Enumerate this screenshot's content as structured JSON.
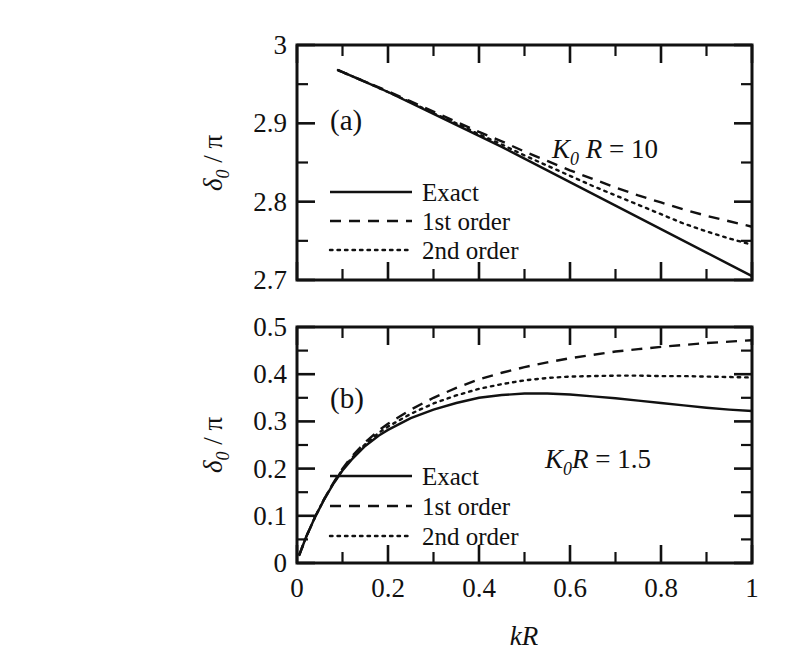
{
  "figure": {
    "xlabel": "kR",
    "ylabel_delta": "δ",
    "ylabel_sub": "0",
    "ylabel_slash": " / π"
  },
  "panel_a": {
    "label": "(a)",
    "annotation_k": "K",
    "annotation_sub": "0",
    "annotation_r": " R ",
    "annotation_eq": "= 10",
    "ytick_labels": [
      "2.7",
      "2.8",
      "2.9",
      "3"
    ],
    "legend": [
      {
        "label": "Exact",
        "style": "solid"
      },
      {
        "label": "1st order",
        "style": "dashed"
      },
      {
        "label": "2nd order",
        "style": "dotted"
      }
    ]
  },
  "panel_b": {
    "label": "(b)",
    "annotation_k": "K",
    "annotation_sub": "0",
    "annotation_r": "R ",
    "annotation_eq": " = 1.5",
    "ytick_labels": [
      "0",
      "0.1",
      "0.2",
      "0.3",
      "0.4",
      "0.5"
    ],
    "xtick_labels": [
      "0",
      "0.2",
      "0.4",
      "0.6",
      "0.8",
      "1"
    ],
    "legend": [
      {
        "label": "Exact",
        "style": "solid"
      },
      {
        "label": "1st order",
        "style": "dashed"
      },
      {
        "label": "2nd order",
        "style": "dotted"
      }
    ]
  },
  "chart_data": {
    "type": "line",
    "title": "",
    "xlabel": "kR",
    "ylabel": "δ₀ / π",
    "panels": [
      {
        "id": "a",
        "label": "(a)",
        "annotation": "K₀ R = 10",
        "xlim": [
          0,
          1
        ],
        "ylim": [
          2.7,
          3.0
        ],
        "xticks": [
          0,
          0.2,
          0.4,
          0.6,
          0.8,
          1.0
        ],
        "yticks": [
          2.7,
          2.8,
          2.9,
          3.0
        ],
        "yminor": [
          2.75,
          2.85,
          2.95
        ],
        "xminor": [
          0.1,
          0.3,
          0.5,
          0.7,
          0.9
        ],
        "grid": false,
        "legend_position": "lower-left-inside",
        "series": [
          {
            "name": "Exact",
            "style": "solid",
            "x": [
              0.09,
              0.15,
              0.2,
              0.25,
              0.3,
              0.35,
              0.4,
              0.45,
              0.5,
              0.55,
              0.6,
              0.65,
              0.7,
              0.75,
              0.8,
              0.85,
              0.9,
              0.95,
              1.0
            ],
            "y": [
              2.968,
              2.953,
              2.94,
              2.926,
              2.912,
              2.898,
              2.884,
              2.87,
              2.855,
              2.84,
              2.825,
              2.81,
              2.795,
              2.78,
              2.765,
              2.75,
              2.735,
              2.72,
              2.705
            ]
          },
          {
            "name": "1st order",
            "style": "dashed",
            "x": [
              0.09,
              0.15,
              0.2,
              0.25,
              0.3,
              0.35,
              0.4,
              0.45,
              0.5,
              0.55,
              0.6,
              0.65,
              0.7,
              0.75,
              0.8,
              0.85,
              0.9,
              0.95,
              1.0
            ],
            "y": [
              2.968,
              2.953,
              2.941,
              2.928,
              2.915,
              2.902,
              2.889,
              2.877,
              2.864,
              2.852,
              2.84,
              2.829,
              2.818,
              2.808,
              2.799,
              2.79,
              2.782,
              2.775,
              2.768
            ]
          },
          {
            "name": "2nd order",
            "style": "dotted",
            "x": [
              0.09,
              0.15,
              0.2,
              0.25,
              0.3,
              0.35,
              0.4,
              0.45,
              0.5,
              0.55,
              0.6,
              0.65,
              0.7,
              0.75,
              0.8,
              0.85,
              0.9,
              0.95,
              1.0
            ],
            "y": [
              2.968,
              2.953,
              2.94,
              2.927,
              2.913,
              2.9,
              2.886,
              2.873,
              2.859,
              2.846,
              2.833,
              2.82,
              2.808,
              2.796,
              2.784,
              2.772,
              2.762,
              2.753,
              2.745
            ]
          }
        ]
      },
      {
        "id": "b",
        "label": "(b)",
        "annotation": "K₀R = 1.5",
        "xlim": [
          0,
          1
        ],
        "ylim": [
          0,
          0.5
        ],
        "xticks": [
          0,
          0.2,
          0.4,
          0.6,
          0.8,
          1.0
        ],
        "yticks": [
          0,
          0.1,
          0.2,
          0.3,
          0.4,
          0.5
        ],
        "yminor": [
          0.05,
          0.15,
          0.25,
          0.35,
          0.45
        ],
        "xminor": [
          0.1,
          0.3,
          0.5,
          0.7,
          0.9
        ],
        "grid": false,
        "legend_position": "lower-left-inside",
        "series": [
          {
            "name": "Exact",
            "style": "solid",
            "x": [
              0.005,
              0.02,
              0.04,
              0.06,
              0.08,
              0.1,
              0.12,
              0.15,
              0.18,
              0.2,
              0.25,
              0.3,
              0.35,
              0.4,
              0.45,
              0.5,
              0.55,
              0.6,
              0.65,
              0.7,
              0.75,
              0.8,
              0.85,
              0.9,
              0.95,
              1.0
            ],
            "y": [
              0.017,
              0.055,
              0.098,
              0.135,
              0.168,
              0.196,
              0.219,
              0.248,
              0.27,
              0.282,
              0.307,
              0.325,
              0.339,
              0.35,
              0.356,
              0.359,
              0.359,
              0.357,
              0.353,
              0.349,
              0.344,
              0.339,
              0.334,
              0.329,
              0.325,
              0.322
            ]
          },
          {
            "name": "1st order",
            "style": "dashed",
            "x": [
              0.005,
              0.02,
              0.04,
              0.06,
              0.08,
              0.1,
              0.12,
              0.15,
              0.18,
              0.2,
              0.25,
              0.3,
              0.35,
              0.4,
              0.45,
              0.5,
              0.55,
              0.6,
              0.65,
              0.7,
              0.75,
              0.8,
              0.85,
              0.9,
              0.95,
              1.0
            ],
            "y": [
              0.017,
              0.055,
              0.098,
              0.136,
              0.17,
              0.2,
              0.225,
              0.256,
              0.281,
              0.295,
              0.325,
              0.35,
              0.371,
              0.389,
              0.403,
              0.415,
              0.425,
              0.434,
              0.441,
              0.448,
              0.453,
              0.458,
              0.462,
              0.466,
              0.469,
              0.472
            ]
          },
          {
            "name": "2nd order",
            "style": "dotted",
            "x": [
              0.005,
              0.02,
              0.04,
              0.06,
              0.08,
              0.1,
              0.12,
              0.15,
              0.18,
              0.2,
              0.25,
              0.3,
              0.35,
              0.4,
              0.45,
              0.5,
              0.55,
              0.6,
              0.65,
              0.7,
              0.75,
              0.8,
              0.85,
              0.9,
              0.95,
              1.0
            ],
            "y": [
              0.017,
              0.055,
              0.098,
              0.136,
              0.169,
              0.198,
              0.222,
              0.252,
              0.276,
              0.289,
              0.316,
              0.338,
              0.355,
              0.369,
              0.379,
              0.387,
              0.392,
              0.395,
              0.396,
              0.397,
              0.397,
              0.396,
              0.396,
              0.395,
              0.394,
              0.393
            ]
          }
        ]
      }
    ]
  }
}
